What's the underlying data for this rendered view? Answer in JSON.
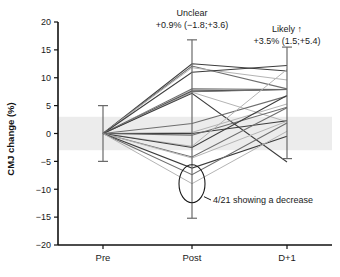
{
  "chart_data": {
    "type": "line",
    "title": "",
    "xlabel": "",
    "ylabel": "CMJ change (%)",
    "categories": [
      "Pre",
      "Post",
      "D+1"
    ],
    "x": [
      0,
      1,
      2
    ],
    "ylim": [
      -20,
      20
    ],
    "yticks": [
      20,
      15,
      10,
      5,
      0,
      -5,
      -10,
      -15,
      -20
    ],
    "ytick_labels": [
      "20",
      "15",
      "10",
      "5",
      "0",
      "-5",
      "-10",
      "-15",
      "-20"
    ],
    "grid": false,
    "legend": "none",
    "shaded_band": {
      "label": "trivial zone",
      "from": -3.0,
      "to": 3.0,
      "color": "#ececec"
    },
    "series": [
      {
        "name": "P01",
        "values": [
          0,
          12.5,
          11.2
        ]
      },
      {
        "name": "P02",
        "values": [
          0,
          12.1,
          8.0
        ]
      },
      {
        "name": "P03",
        "values": [
          0,
          11.8,
          9.6
        ]
      },
      {
        "name": "P04",
        "values": [
          0,
          11.0,
          12.2
        ]
      },
      {
        "name": "P05",
        "values": [
          0,
          8.0,
          7.9
        ]
      },
      {
        "name": "P06",
        "values": [
          0,
          7.8,
          7.9
        ]
      },
      {
        "name": "P07",
        "values": [
          0,
          7.6,
          7.9
        ]
      },
      {
        "name": "P08",
        "values": [
          0,
          7.5,
          7.9
        ]
      },
      {
        "name": "P09",
        "values": [
          0,
          7.4,
          2.1
        ]
      },
      {
        "name": "P10",
        "values": [
          0,
          7.2,
          -5.1
        ]
      },
      {
        "name": "P11",
        "values": [
          0,
          1.8,
          6.7
        ]
      },
      {
        "name": "P12",
        "values": [
          0,
          0.2,
          5.3
        ]
      },
      {
        "name": "P13",
        "values": [
          0,
          0.0,
          2.3
        ]
      },
      {
        "name": "P14",
        "values": [
          0,
          -0.3,
          4.7
        ]
      },
      {
        "name": "P15",
        "values": [
          0,
          -2.3,
          11.5
        ]
      },
      {
        "name": "P16",
        "values": [
          0,
          -2.5,
          6.8
        ]
      },
      {
        "name": "P17",
        "values": [
          0,
          -4.2,
          4.6
        ]
      },
      {
        "name": "P18",
        "values": [
          0,
          -4.4,
          2.2
        ]
      },
      {
        "name": "P19",
        "values": [
          0,
          -6.2,
          -0.5
        ]
      },
      {
        "name": "P20",
        "values": [
          0,
          -7.4,
          1.9
        ]
      },
      {
        "name": "P21",
        "values": [
          0,
          -9.0,
          0.4
        ]
      }
    ],
    "error_bars": [
      {
        "x": "Pre",
        "mean": 0.0,
        "upper": 5.0,
        "lower": -5.0
      },
      {
        "x": "Post",
        "mean": 0.9,
        "upper": 16.8,
        "lower": -15.2
      },
      {
        "x": "D+1",
        "mean": 3.5,
        "upper": 15.5,
        "lower": -4.5
      }
    ],
    "annotations": [
      {
        "name": "post-effect",
        "line1": "Unclear",
        "line2": "+0.9% (−1.8;+3.6)",
        "at": "Post"
      },
      {
        "name": "d1-effect",
        "line1": "Likely ↑",
        "line2": "+3.5% (1.5;+5.4)",
        "at": "D+1"
      },
      {
        "name": "decrease-callout",
        "text": "4/21 showing a decrease",
        "at": "Post",
        "ellipse_center_y": -9.0
      }
    ]
  },
  "axis": {
    "y_title": "CMJ change (%)",
    "y_tick_labels": [
      "20",
      "15",
      "10",
      "5",
      "0",
      "−5",
      "−10",
      "−15",
      "−20"
    ],
    "x_tick_labels": [
      "Pre",
      "Post",
      "D+1"
    ]
  },
  "annotations": {
    "post_label_line1": "Unclear",
    "post_label_line2": "+0.9% (−1.8;+3.6)",
    "d1_label_line1": "Likely ↑",
    "d1_label_line2": "+3.5% (1.5;+5.4)",
    "callout_text": "4/21 showing a decrease"
  },
  "colors": {
    "axis": "#111111",
    "band": "#ececec",
    "line_dark": "#3c3c3c",
    "line_mid": "#6e6e6e",
    "line_light": "#b4b4b4",
    "errorbar": "#6a6a6a",
    "ellipse": "#1a1a1a"
  }
}
